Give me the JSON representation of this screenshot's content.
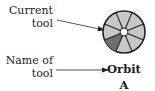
{
  "labels": {
    "current_tool": [
      "Current",
      "tool"
    ],
    "name_of_tool": [
      "Name of",
      "tool"
    ]
  },
  "tool": {
    "name": "Orbit",
    "shortcut": "A"
  },
  "wheel": {
    "segments": 8,
    "highlighted_segment": "left",
    "colors": {
      "segment": "#c8c8c8",
      "highlight": "#6e6e6e",
      "outline": "#222222",
      "hub": "#ffffff"
    }
  }
}
